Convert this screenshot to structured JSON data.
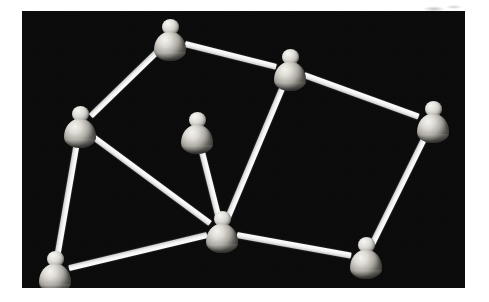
{
  "figure": {
    "canvas": {
      "x": 22,
      "y": 11,
      "width": 443,
      "height": 277,
      "background_color": "#080808",
      "node_color": "#dedcd6",
      "edge_color": "#ffffff",
      "page_background_color": "#ffffff"
    },
    "artifact": {
      "name": "scan-smudge",
      "x": 424,
      "y": 2,
      "width": 44,
      "height": 12
    }
  },
  "graph": {
    "node_count": 8,
    "edge_count": 10,
    "nodes": [
      {
        "id": "n1",
        "label": "peer-top",
        "x": 170,
        "y": 40,
        "degree": 2
      },
      {
        "id": "n2",
        "label": "peer-upper-right",
        "x": 290,
        "y": 70,
        "degree": 3
      },
      {
        "id": "n3",
        "label": "peer-right",
        "x": 433,
        "y": 122,
        "degree": 2
      },
      {
        "id": "n4",
        "label": "peer-left",
        "x": 80,
        "y": 127,
        "degree": 3
      },
      {
        "id": "n5",
        "label": "peer-center-upper",
        "x": 197,
        "y": 133,
        "degree": 1
      },
      {
        "id": "n6",
        "label": "peer-hub-center",
        "x": 222,
        "y": 232,
        "degree": 5
      },
      {
        "id": "n7",
        "label": "peer-bottom-left",
        "x": 55,
        "y": 272,
        "degree": 2
      },
      {
        "id": "n8",
        "label": "peer-bottom-right",
        "x": 366,
        "y": 258,
        "degree": 2
      }
    ],
    "edges": [
      {
        "id": "e1",
        "from": "n1",
        "to": "n2",
        "label": "top to upper-right"
      },
      {
        "id": "e2",
        "from": "n1",
        "to": "n4",
        "label": "top to left"
      },
      {
        "id": "e3",
        "from": "n2",
        "to": "n3",
        "label": "upper-right to right"
      },
      {
        "id": "e4",
        "from": "n2",
        "to": "n6",
        "label": "upper-right to hub"
      },
      {
        "id": "e5",
        "from": "n3",
        "to": "n8",
        "label": "right to bottom-right"
      },
      {
        "id": "e6",
        "from": "n4",
        "to": "n6",
        "label": "left to hub"
      },
      {
        "id": "e7",
        "from": "n4",
        "to": "n7",
        "label": "left to bottom-left"
      },
      {
        "id": "e8",
        "from": "n5",
        "to": "n6",
        "label": "center-upper to hub"
      },
      {
        "id": "e9",
        "from": "n6",
        "to": "n7",
        "label": "hub to bottom-left"
      },
      {
        "id": "e10",
        "from": "n6",
        "to": "n8",
        "label": "hub to bottom-right"
      }
    ],
    "edge_thickness": 6
  }
}
